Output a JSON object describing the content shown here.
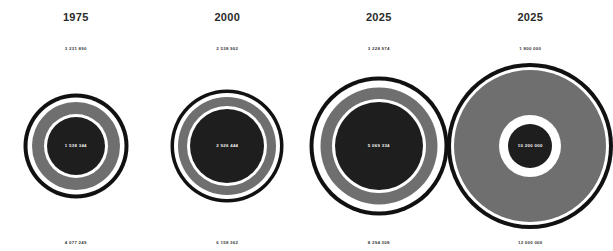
{
  "chart_data": {
    "type": "bullseye-concentric-circles",
    "title": "",
    "grid": false,
    "legend": null,
    "columns": [
      {
        "year": "1975",
        "top_value_label": "3 231 890",
        "top_value": 3231890,
        "center_value_label": "1 538 344",
        "center_value": 1538344,
        "bottom_value_label": "4 077 249",
        "bottom_value": 4077249,
        "outer_diameter_px": 105,
        "gap1_diameter_px": 97,
        "mid_diameter_px": 88,
        "gap2_diameter_px": 64,
        "core_diameter_px": 58
      },
      {
        "year": "2000",
        "top_value_label": "2 538 902",
        "top_value": 2538902,
        "center_value_label": "2 926 444",
        "center_value": 2926444,
        "bottom_value_label": "6 158 362",
        "bottom_value": 6158362,
        "outer_diameter_px": 113,
        "gap1_diameter_px": 106,
        "mid_diameter_px": 98,
        "gap2_diameter_px": 80,
        "core_diameter_px": 74
      },
      {
        "year": "2025",
        "top_value_label": "3 228 974",
        "top_value": 3228974,
        "center_value_label": "5 069 334",
        "center_value": 5069334,
        "bottom_value_label": "8 294 308",
        "bottom_value": 8294308,
        "outer_diameter_px": 139,
        "gap1_diameter_px": 131,
        "mid_diameter_px": 117,
        "gap2_diameter_px": 94,
        "core_diameter_px": 88
      },
      {
        "year": "2025",
        "top_value_label": "1 800 000",
        "top_value": 1800000,
        "center_value_label": "10 200 000",
        "center_value": 10200000,
        "bottom_value_label": "12 000 000",
        "bottom_value": 12000000,
        "outer_diameter_px": 166,
        "gap1_diameter_px": 158,
        "mid_diameter_px": 152,
        "gap2_diameter_px": 62,
        "core_diameter_px": 44
      }
    ],
    "colors": {
      "background": "#ffffff",
      "outer_ring": "#111111",
      "gap": "#ffffff",
      "mid_ring": "#6f6f6f",
      "core": "#1e1e1e",
      "center_text": "#f2f2f2",
      "label_text": "#3a3a3a",
      "year_text": "#2b2b2b"
    }
  }
}
